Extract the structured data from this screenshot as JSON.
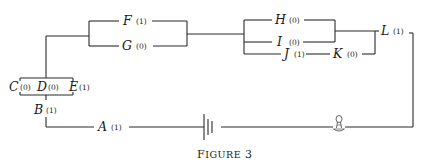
{
  "figure": {
    "caption_prefix": "F",
    "caption_small": "IGURE",
    "caption_number": "3"
  },
  "components": {
    "A": {
      "label": "A",
      "value": "(1)"
    },
    "B": {
      "label": "B",
      "value": "(1)"
    },
    "C": {
      "label": "C",
      "value": "(0)"
    },
    "D": {
      "label": "D",
      "value": "(0)"
    },
    "E": {
      "label": "E",
      "value": "(1)"
    },
    "F": {
      "label": "F",
      "value": "(1)"
    },
    "G": {
      "label": "G",
      "value": "(0)"
    },
    "H": {
      "label": "H",
      "value": "(0)"
    },
    "I": {
      "label": "I",
      "value": "(0)"
    },
    "J": {
      "label": "J",
      "value": "(1)"
    },
    "K": {
      "label": "K",
      "value": "(0)"
    },
    "L": {
      "label": "L",
      "value": "(1)"
    }
  },
  "symbols": {
    "battery": "battery-icon",
    "lamp": "light-bulb-icon"
  }
}
